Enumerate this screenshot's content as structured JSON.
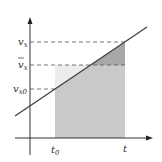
{
  "diagram": {
    "type": "velocity-time graph",
    "y_labels": {
      "vx": "v",
      "vx_sub": "x",
      "vbar": "v",
      "vbar_sub": "x",
      "vx0": "v",
      "vx0_sub": "x0"
    },
    "x_labels": {
      "t0": "t",
      "t0_sub": "0",
      "t": "t"
    },
    "colors": {
      "axis": "#333333",
      "line": "#444444",
      "dash": "#555555",
      "light_fill": "#e6e6e6",
      "mid_fill": "#c8c8c8",
      "dark_fill": "#a9a9a9"
    }
  }
}
